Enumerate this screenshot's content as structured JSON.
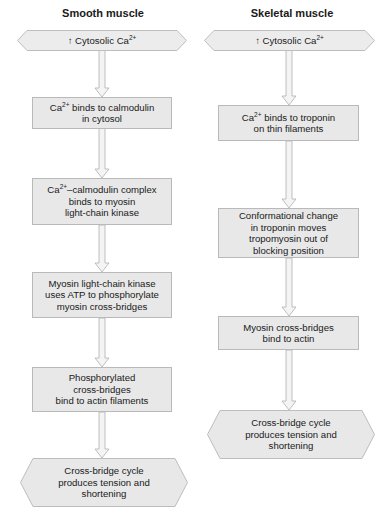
{
  "colors": {
    "box_fill": "#e8e8e8",
    "box_border": "#b9b9b9",
    "arrow_fill": "#f2f2f2",
    "arrow_border": "#b0b0b0",
    "text": "#1a1a1a"
  },
  "smooth": {
    "title": "Smooth muscle",
    "start": {
      "prefix": "↑ Cytosolic Ca",
      "sup": "2+"
    },
    "steps": [
      {
        "lines": [
          {
            "prefix": "Ca",
            "sup": "2+",
            "text": " binds to calmodulin"
          },
          {
            "text": "in cytosol"
          }
        ]
      },
      {
        "lines": [
          {
            "prefix": "Ca",
            "sup": "2+",
            "text": "–calmodulin complex"
          },
          {
            "text": "binds to myosin"
          },
          {
            "text": "light-chain kinase"
          }
        ]
      },
      {
        "lines": [
          {
            "text": "Myosin light-chain kinase"
          },
          {
            "text": "uses ATP to phosphorylate"
          },
          {
            "text": "myosin cross-bridges"
          }
        ]
      },
      {
        "lines": [
          {
            "text": "Phosphorylated"
          },
          {
            "text": "cross-bridges"
          },
          {
            "text": "bind to actin filaments"
          }
        ]
      }
    ],
    "end": {
      "lines": [
        "Cross-bridge cycle",
        "produces tension and",
        "shortening"
      ]
    }
  },
  "skeletal": {
    "title": "Skeletal muscle",
    "start": {
      "prefix": "↑ Cytosolic Ca",
      "sup": "2+"
    },
    "steps": [
      {
        "lines": [
          {
            "prefix": "Ca",
            "sup": "2+",
            "text": " binds to troponin"
          },
          {
            "text": "on thin filaments"
          }
        ]
      },
      {
        "lines": [
          {
            "text": "Conformational change"
          },
          {
            "text": "in troponin moves"
          },
          {
            "text": "tropomyosin out of"
          },
          {
            "text": "blocking position"
          }
        ]
      },
      {
        "lines": [
          {
            "text": "Myosin cross-bridges"
          },
          {
            "text": "bind to actin"
          }
        ]
      }
    ],
    "end": {
      "lines": [
        "Cross-bridge cycle",
        "produces tension and",
        "shortening"
      ]
    }
  }
}
